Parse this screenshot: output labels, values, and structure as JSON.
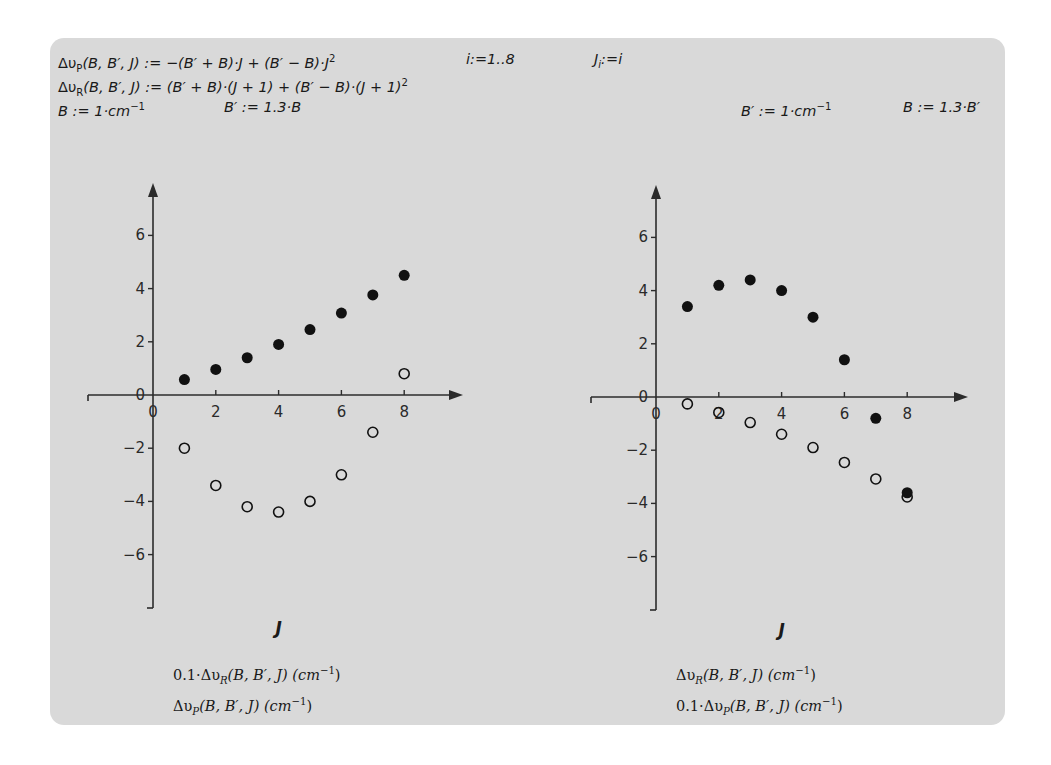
{
  "equations": {
    "dvP_def": "Δυ_P(B, B′, J) := −(B′ + B)·J + (B′ − B)·J²",
    "range_def": "i:=1..8",
    "J_def": "J_i:=i",
    "dvR_def": "Δυ_R(B, B′, J) := (B′ + B)·(J + 1) + (B′ − B)·(J + 1)²",
    "left_B": "B := 1·cm⁻¹",
    "left_Bp": "B′ := 1.3·B",
    "right_Bp": "B′ := 1·cm⁻¹",
    "right_B": "B := 1.3·B′"
  },
  "eq_parts": {
    "dvP_lhs_sub": "P",
    "dvR_lhs_sub": "R",
    "dvP_rhs": "(B, B′, J) := −(B′ + B)·J + (B′ − B)·J",
    "dvR_rhs": "(B, B′, J) := (B′ + B)·(J + 1) + (B′ − B)·(J + 1)",
    "sq": "2",
    "range": "i:=1..8",
    "J_main": "J",
    "J_sub": "i",
    "J_rhs": ":=i",
    "left_B_text": "B := 1·cm",
    "left_Bp_text": "B′ := 1.3·B",
    "right_Bp_text": "B′ := 1·cm",
    "right_B_text": "B := 1.3·B′",
    "inv": "−1",
    "delta_upsilon": "Δυ"
  },
  "chart_data": [
    {
      "type": "scatter",
      "title": "",
      "xlabel": "J",
      "ylabel": "",
      "xlim": [
        -2,
        10
      ],
      "ylim": [
        -7.5,
        8
      ],
      "x_ticks": [
        "0",
        "2",
        "4",
        "6",
        "8"
      ],
      "y_ticks": [
        "−6",
        "−4",
        "−2",
        "0",
        "2",
        "4",
        "6"
      ],
      "grid": false,
      "legend_position": "below",
      "parameters": {
        "B": "1 cm⁻¹",
        "B′": "1.3·B"
      },
      "x": [
        1,
        2,
        3,
        4,
        5,
        6,
        7,
        8
      ],
      "series": [
        {
          "name": "0.1·Δυ_R(B, B′, J) (cm⁻¹)",
          "marker": "filled-circle",
          "values": [
            0.58,
            0.96,
            1.4,
            1.9,
            2.46,
            3.08,
            3.76,
            4.5
          ]
        },
        {
          "name": "Δυ_P(B, B′, J) (cm⁻¹)",
          "marker": "open-circle",
          "values": [
            -2.0,
            -3.4,
            -4.2,
            -4.4,
            -4.0,
            -3.0,
            -1.4,
            0.8
          ]
        }
      ],
      "legend": [
        "0.1·Δυ_R(B, B′, J) (cm⁻¹)",
        "Δυ_P(B, B′, J) (cm⁻¹)"
      ]
    },
    {
      "type": "scatter",
      "title": "",
      "xlabel": "J",
      "ylabel": "",
      "xlim": [
        -2,
        10
      ],
      "ylim": [
        -7.5,
        8
      ],
      "x_ticks": [
        "0",
        "2",
        "4",
        "6",
        "8"
      ],
      "y_ticks": [
        "−6",
        "−4",
        "−2",
        "0",
        "2",
        "4",
        "6"
      ],
      "grid": false,
      "legend_position": "below",
      "parameters": {
        "B′": "1 cm⁻¹",
        "B": "1.3·B′"
      },
      "x": [
        1,
        2,
        3,
        4,
        5,
        6,
        7,
        8
      ],
      "series": [
        {
          "name": "Δυ_R(B, B′, J) (cm⁻¹)",
          "marker": "filled-circle",
          "values": [
            3.4,
            4.2,
            4.4,
            4.0,
            3.0,
            1.4,
            -0.8,
            -3.6
          ]
        },
        {
          "name": "0.1·Δυ_P(B, B′, J) (cm⁻¹)",
          "marker": "open-circle",
          "values": [
            -0.26,
            -0.58,
            -0.96,
            -1.4,
            -1.9,
            -2.46,
            -3.08,
            -3.76
          ]
        }
      ],
      "legend": [
        "Δυ_R(B, B′, J) (cm⁻¹)",
        "0.1·Δυ_P(B, B′, J) (cm⁻¹)"
      ]
    }
  ],
  "legends": {
    "left": {
      "line1_prefix": "0.1·Δυ",
      "line1_sub": "R",
      "line1_rest": "(B, B′, J) (cm",
      "line1_sup": "−1",
      "line1_close": ")",
      "line2_prefix": "Δυ",
      "line2_sub": "P",
      "line2_rest": "(B, B′, J) (cm",
      "line2_sup": "−1",
      "line2_close": ")"
    },
    "right": {
      "line1_prefix": "Δυ",
      "line1_sub": "R",
      "line1_rest": "(B, B′, J) (cm",
      "line1_sup": "−1",
      "line1_close": ")",
      "line2_prefix": "0.1·Δυ",
      "line2_sub": "P",
      "line2_rest": "(B, B′, J) (cm",
      "line2_sup": "−1",
      "line2_close": ")"
    }
  },
  "colors": {
    "panel_bg": "#d9d9d9",
    "axis": "#2b2b2b",
    "marker": "#111111"
  }
}
